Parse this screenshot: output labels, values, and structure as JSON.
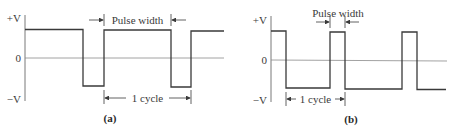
{
  "figure": {
    "panels": [
      {
        "id": "a",
        "caption": "(a)",
        "y_labels": {
          "high": "+V",
          "zero": "0",
          "low": "−V"
        },
        "pulse_width_label": "Pulse width",
        "cycle_label": "1 cycle",
        "description": "Pulse waveform with long positive pulses (wide duty cycle)"
      },
      {
        "id": "b",
        "caption": "(b)",
        "y_labels": {
          "high": "+V",
          "zero": "0",
          "low": "−V"
        },
        "pulse_width_label": "Pulse width",
        "cycle_label": "1 cycle",
        "description": "Pulse waveform with short positive pulses (narrow duty cycle)"
      }
    ]
  }
}
